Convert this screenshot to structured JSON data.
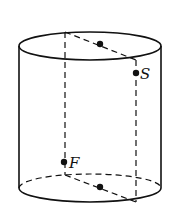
{
  "diagram": {
    "type": "cylinder",
    "points": {
      "S": {
        "label": "S",
        "x": 136,
        "y": 73
      },
      "F": {
        "label": "F",
        "x": 64,
        "y": 162
      },
      "top_midpoint": {
        "label": "",
        "x": 100,
        "y": 44
      },
      "bottom_midpoint": {
        "label": "",
        "x": 100,
        "y": 187
      }
    },
    "labels": {
      "S": "S",
      "F": "F"
    },
    "colors": {
      "stroke": "#111111",
      "background": "#ffffff"
    }
  }
}
